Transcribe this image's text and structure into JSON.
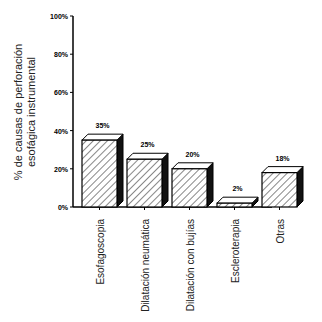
{
  "chart_data": {
    "type": "bar",
    "title": "",
    "xlabel": "",
    "ylabel": "% de causas de perforación esofágica instrumental",
    "ylabel_lines": [
      "% de causas de perforación",
      "esofágica instrumental"
    ],
    "categories": [
      "Esofagoscopia",
      "Dilatación neumática",
      "Dilatación con bujías",
      "Escleroterapia",
      "Otras"
    ],
    "values": [
      35,
      25,
      20,
      2,
      18
    ],
    "value_labels": [
      "35%",
      "25%",
      "20%",
      "2%",
      "18%"
    ],
    "ylim": [
      0,
      100
    ],
    "yticks": [
      0,
      20,
      40,
      60,
      80,
      100
    ],
    "ytick_labels": [
      "0%",
      "20%",
      "40%",
      "60%",
      "80%",
      "100%"
    ],
    "grid": false,
    "legend": null,
    "style": "3d hatched bars"
  }
}
